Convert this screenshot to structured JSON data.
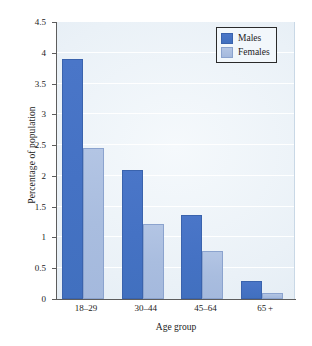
{
  "chart_data": {
    "type": "bar",
    "title": "",
    "subtitle": "",
    "xlabel": "Age group",
    "ylabel": "Percentage of population",
    "categories": [
      "18–29",
      "30–44",
      "45–64",
      "65 +"
    ],
    "series": [
      {
        "name": "Males",
        "color": "#4472C4",
        "values": [
          3.9,
          2.1,
          1.37,
          0.3
        ]
      },
      {
        "name": "Females",
        "color": "#A8BCE0",
        "values": [
          2.45,
          1.22,
          0.78,
          0.1
        ]
      }
    ],
    "ylim": [
      0,
      4.5
    ],
    "yticks": [
      0,
      0.5,
      1,
      1.5,
      2,
      2.5,
      3,
      3.5,
      4,
      4.5
    ],
    "ytick_labels": [
      "0",
      "0.5",
      "1",
      "1.5",
      "2",
      "2.5",
      "3",
      "3.5",
      "4",
      "4.5"
    ],
    "grid": "horizontal",
    "legend_position": "top-right",
    "annotations": []
  },
  "legend": {
    "items": [
      {
        "label": "Males",
        "swatch": "male-color-swatch"
      },
      {
        "label": "Females",
        "swatch": "female-color-swatch"
      }
    ]
  },
  "axes": {
    "x_title": "Age group",
    "y_title": "Percentage of population"
  },
  "colors": {
    "male_bar": "#4472C4",
    "female_bar": "#A8BCE0",
    "plot_background": "#EDF3F8",
    "gridline": "#FFFFFF",
    "axis_line": "#5D5D5D",
    "text": "#1B1B1B"
  }
}
